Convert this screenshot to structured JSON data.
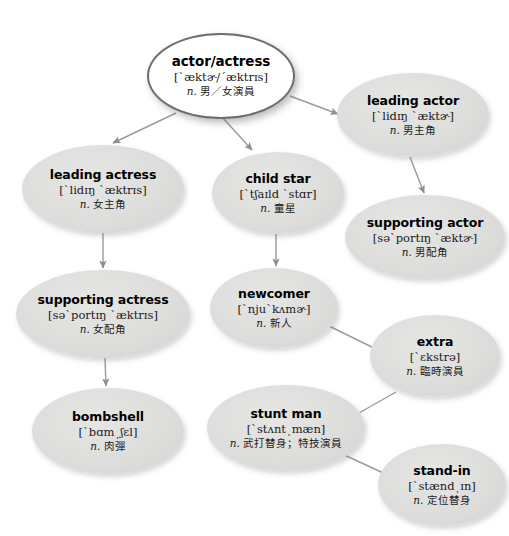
{
  "diagram": {
    "type": "tree-diagram",
    "background_color": "#ffffff",
    "node_fill_color": "#dcdcdb",
    "root_fill_color": "#ffffff",
    "edge_color": "#9a9a9a"
  },
  "nodes": [
    {
      "id": "actor-actress",
      "term": "actor/actress",
      "phonetic": "[ˋæktɚ/ˊæktrɪs]",
      "pos": "n.",
      "cn": "男／女演員",
      "is_root": true,
      "x": 147,
      "y": 33,
      "w": 148,
      "h": 86
    },
    {
      "id": "leading-actor",
      "term": "leading actor",
      "phonetic": "[ˋlidɪŋ ˋæktɚ]",
      "pos": "n.",
      "cn": "男主角",
      "is_root": false,
      "x": 337,
      "y": 73,
      "w": 152,
      "h": 84
    },
    {
      "id": "leading-actress",
      "term": "leading actress",
      "phonetic": "[ˋlidɪŋ ˋæktrɪs]",
      "pos": "n.",
      "cn": "女主角",
      "is_root": false,
      "x": 22,
      "y": 145,
      "w": 162,
      "h": 88
    },
    {
      "id": "child-star",
      "term": "child star",
      "phonetic": "[ˋtʃaɪld ˋstɑr]",
      "pos": "n.",
      "cn": "童星",
      "is_root": false,
      "x": 212,
      "y": 152,
      "w": 132,
      "h": 82
    },
    {
      "id": "supporting-actor",
      "term": "supporting actor",
      "phonetic": "[səˋportɪŋ ˋæktɚ]",
      "pos": "n.",
      "cn": "男配角",
      "is_root": false,
      "x": 345,
      "y": 195,
      "w": 160,
      "h": 84
    },
    {
      "id": "supporting-actress",
      "term": "supporting actress",
      "phonetic": "[səˋportɪŋ ˋæktrɪs]",
      "pos": "n.",
      "cn": "女配角",
      "is_root": false,
      "x": 16,
      "y": 270,
      "w": 174,
      "h": 88
    },
    {
      "id": "newcomer",
      "term": "newcomer",
      "phonetic": "[ˋnjuˋkʌmɚ]",
      "pos": "n.",
      "cn": "新人",
      "is_root": false,
      "x": 210,
      "y": 268,
      "w": 128,
      "h": 80
    },
    {
      "id": "extra",
      "term": "extra",
      "phonetic": "[ˋɛkstrə]",
      "pos": "n.",
      "cn": "臨時演員",
      "is_root": false,
      "x": 370,
      "y": 315,
      "w": 130,
      "h": 82
    },
    {
      "id": "bombshell",
      "term": "bombshell",
      "phonetic": "[ˋbɑmͺʃɛl]",
      "pos": "n.",
      "cn": "肉彈",
      "is_root": false,
      "x": 32,
      "y": 388,
      "w": 152,
      "h": 86
    },
    {
      "id": "stunt-man",
      "term": "stunt man",
      "phonetic": "[ˋstʌntͺmæn]",
      "pos": "n.",
      "cn": "武打替身；特技演員",
      "is_root": false,
      "x": 207,
      "y": 385,
      "w": 158,
      "h": 86
    },
    {
      "id": "stand-in",
      "term": "stand-in",
      "phonetic": "[ˋstændͺɪn]",
      "pos": "n.",
      "cn": "定位替身",
      "is_root": false,
      "x": 378,
      "y": 444,
      "w": 128,
      "h": 82
    }
  ],
  "edges": [
    {
      "id": "edge-root-leading-actor",
      "from": "actor-actress",
      "to": "leading-actor",
      "path": "M 290 96 L 338 114"
    },
    {
      "id": "edge-root-leading-actress",
      "from": "actor-actress",
      "to": "leading-actress",
      "path": "M 176 113 L 113 143"
    },
    {
      "id": "edge-root-child-star",
      "from": "actor-actress",
      "to": "child-star",
      "path": "M 223 118 L 252 150"
    },
    {
      "id": "edge-leading-actor-supporting",
      "from": "leading-actor",
      "to": "supporting-actor",
      "path": "M 410 157 L 424 193"
    },
    {
      "id": "edge-leading-actress-supp",
      "from": "leading-actress",
      "to": "supporting-actress",
      "path": "M 103 233 L 103 268"
    },
    {
      "id": "edge-child-star-newcomer",
      "from": "child-star",
      "to": "newcomer",
      "path": "M 276 234 L 276 266"
    },
    {
      "id": "edge-supp-actress-bombshell",
      "from": "supporting-actress",
      "to": "bombshell",
      "path": "M 105 358 L 106 386"
    },
    {
      "id": "edge-newcomer-extra",
      "from": "newcomer",
      "to": "extra",
      "path": "M 327 325 L 382 352"
    },
    {
      "id": "edge-extra-stunt-man",
      "from": "extra",
      "to": "stunt-man",
      "path": "M 396 392 L 352 417"
    },
    {
      "id": "edge-stunt-man-stand-in",
      "from": "stunt-man",
      "to": "stand-in",
      "path": "M 338 452 L 394 478"
    }
  ]
}
